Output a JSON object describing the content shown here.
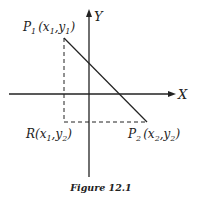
{
  "figure": {
    "caption": "Figure 12.1",
    "axes": {
      "x_label": "X",
      "y_label": "Y"
    },
    "points": {
      "p1": {
        "name": "P",
        "sub": "1",
        "coords_open": "(",
        "x": "x",
        "x_sub": "1",
        "sep": ",",
        "y": "y",
        "y_sub": "1",
        "coords_close": ")"
      },
      "p2": {
        "name": "P",
        "sub": "2",
        "coords_open": "(",
        "x": "x",
        "x_sub": "2",
        "sep": ",",
        "y": "y",
        "y_sub": "2",
        "coords_close": ")"
      },
      "r": {
        "name": "R",
        "coords_open": "(",
        "x": "x",
        "x_sub": "1",
        "sep": ",",
        "y": "y",
        "y_sub": "2",
        "coords_close": ")"
      }
    },
    "colors": {
      "ink": "#222222",
      "background": "#ffffff"
    }
  }
}
